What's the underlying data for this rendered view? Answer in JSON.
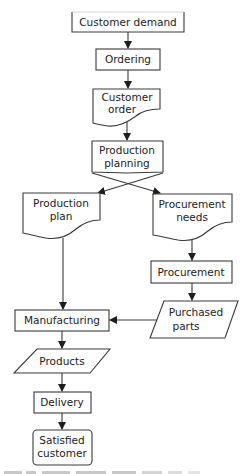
{
  "diagram": {
    "type": "flowchart",
    "nodes": {
      "customer_demand": {
        "label": "Customer demand",
        "shape": "open-top-box"
      },
      "ordering": {
        "label": "Ordering",
        "shape": "process"
      },
      "customer_order": {
        "line1": "Customer",
        "line2": "order",
        "shape": "document"
      },
      "production_planning": {
        "line1": "Production",
        "line2": "planning",
        "shape": "process"
      },
      "production_plan": {
        "line1": "Production",
        "line2": "plan",
        "shape": "document"
      },
      "procurement_needs": {
        "line1": "Procurement",
        "line2": "needs",
        "shape": "document"
      },
      "procurement": {
        "label": "Procurement",
        "shape": "process"
      },
      "purchased_parts": {
        "line1": "Purchased",
        "line2": "parts",
        "shape": "data"
      },
      "manufacturing": {
        "label": "Manufacturing",
        "shape": "process"
      },
      "products": {
        "label": "Products",
        "shape": "data"
      },
      "delivery": {
        "label": "Delivery",
        "shape": "process"
      },
      "satisfied_customer": {
        "line1": "Satisfied",
        "line2": "customer",
        "shape": "terminal"
      }
    },
    "edges": [
      {
        "from": "Customer demand",
        "to": "Ordering"
      },
      {
        "from": "Ordering",
        "to": "Customer order"
      },
      {
        "from": "Customer order",
        "to": "Production planning"
      },
      {
        "from": "Production planning",
        "to": "Production plan"
      },
      {
        "from": "Production planning",
        "to": "Procurement needs"
      },
      {
        "from": "Production plan",
        "to": "Manufacturing"
      },
      {
        "from": "Procurement needs",
        "to": "Procurement"
      },
      {
        "from": "Procurement",
        "to": "Purchased parts"
      },
      {
        "from": "Purchased parts",
        "to": "Manufacturing"
      },
      {
        "from": "Manufacturing",
        "to": "Products"
      },
      {
        "from": "Products",
        "to": "Delivery"
      },
      {
        "from": "Delivery",
        "to": "Satisfied customer"
      }
    ],
    "caption": "Figure 2.2 Flowchart (caption cut off)"
  }
}
